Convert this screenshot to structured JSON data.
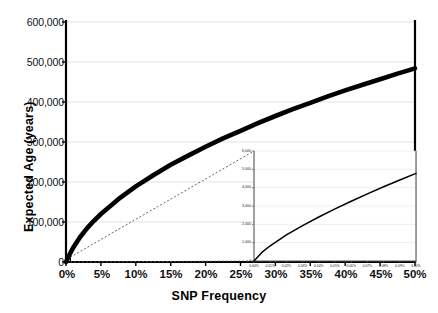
{
  "chart_data": {
    "type": "line",
    "title": "",
    "xlabel": "SNP Frequency",
    "ylabel": "Expected Age (years)",
    "xlim": [
      0,
      50
    ],
    "ylim": [
      0,
      600000
    ],
    "grid": true,
    "legend": "none",
    "x_tick_labels": [
      "0%",
      "5%",
      "10%",
      "15%",
      "20%",
      "25%",
      "30%",
      "35%",
      "40%",
      "45%",
      "50%"
    ],
    "x_tick_values": [
      0,
      5,
      10,
      15,
      20,
      25,
      30,
      35,
      40,
      45,
      50
    ],
    "y_tick_labels": [
      "0",
      "100,000",
      "200,000",
      "300,000",
      "400,000",
      "500,000",
      "600,000"
    ],
    "y_tick_values": [
      0,
      100000,
      200000,
      300000,
      400000,
      500000,
      600000
    ],
    "series": [
      {
        "name": "Expected Age",
        "style": "thick-solid-black",
        "x": [
          0,
          0.5,
          1,
          2,
          3,
          4,
          5,
          7.5,
          10,
          12.5,
          15,
          17.5,
          20,
          22.5,
          25,
          27.5,
          30,
          32.5,
          35,
          37.5,
          40,
          42.5,
          45,
          47.5,
          50
        ],
        "y": [
          0,
          18000,
          35000,
          62000,
          84000,
          103000,
          120000,
          157000,
          189000,
          217000,
          243000,
          266000,
          288000,
          309000,
          328000,
          347000,
          365000,
          382000,
          398000,
          414000,
          429000,
          443000,
          457000,
          471000,
          484000
        ]
      }
    ],
    "annotations": [
      {
        "name": "zoom-region-box",
        "x_range": [
          0,
          0.6
        ],
        "y_range": [
          0,
          12000
        ]
      },
      {
        "name": "leader-line-upper",
        "style": "dashed-thin"
      },
      {
        "name": "leader-line-lower",
        "style": "dashed-thin"
      }
    ],
    "inset": {
      "type": "line",
      "xlabel": "",
      "ylabel": "",
      "xlim": [
        0,
        0.1
      ],
      "ylim": [
        0,
        6000
      ],
      "grid": true,
      "x_tick_labels": [
        "0.00%",
        "0.01%",
        "0.02%",
        "0.03%",
        "0.04%",
        "0.05%",
        "0.06%",
        "0.07%",
        "0.08%",
        "0.09%",
        "0.10%"
      ],
      "x_tick_values": [
        0,
        0.01,
        0.02,
        0.03,
        0.04,
        0.05,
        0.06,
        0.07,
        0.08,
        0.09,
        0.1
      ],
      "y_tick_labels": [
        "0",
        "1,000",
        "2,000",
        "3,000",
        "4,000",
        "5,000",
        "6,000"
      ],
      "y_tick_values": [
        0,
        1000,
        2000,
        3000,
        4000,
        5000,
        6000
      ],
      "series": [
        {
          "name": "Expected Age (low frequency)",
          "style": "thin-solid-black",
          "x": [
            0,
            0.005,
            0.01,
            0.02,
            0.03,
            0.04,
            0.05,
            0.06,
            0.07,
            0.08,
            0.09,
            0.1
          ],
          "y": [
            0,
            480,
            830,
            1420,
            1930,
            2400,
            2840,
            3260,
            3660,
            4050,
            4420,
            4780
          ]
        }
      ]
    }
  }
}
